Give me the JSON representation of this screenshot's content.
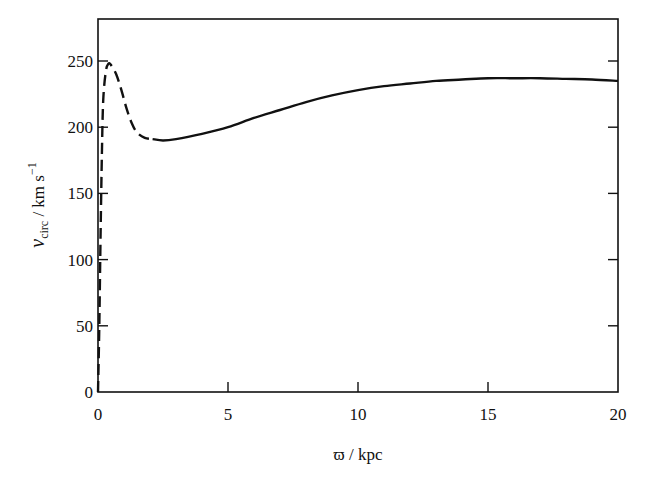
{
  "chart_data": {
    "type": "line",
    "title": "",
    "xlabel": "ϖ / kpc",
    "ylabel": "v_circ / km s^-1",
    "ylabel_parts": {
      "v": "v",
      "sub": "circ",
      "unit": " / km s",
      "sup": "−1"
    },
    "xlim": [
      0,
      20
    ],
    "ylim": [
      0,
      280
    ],
    "xticks": [
      0,
      5,
      10,
      15,
      20
    ],
    "yticks": [
      0,
      50,
      100,
      150,
      200,
      250
    ],
    "grid": false,
    "legend": null,
    "series": [
      {
        "name": "inner (dashed)",
        "style": "dashed",
        "x": [
          0.0,
          0.05,
          0.1,
          0.15,
          0.2,
          0.3,
          0.4,
          0.5,
          0.7,
          0.9,
          1.1,
          1.3,
          1.5,
          1.8,
          2.1
        ],
        "y": [
          0,
          50,
          120,
          180,
          220,
          242,
          248,
          247,
          240,
          228,
          214,
          203,
          196,
          192,
          191
        ]
      },
      {
        "name": "outer (solid)",
        "style": "solid",
        "x": [
          2.1,
          2.5,
          3,
          4,
          5,
          6,
          7,
          8,
          9,
          10,
          11,
          12,
          13,
          14,
          15,
          16,
          17,
          18,
          19,
          20
        ],
        "y": [
          191,
          190,
          191,
          195,
          200,
          207,
          213,
          219,
          224,
          228,
          231,
          233,
          235,
          236,
          237,
          237,
          237,
          236.5,
          236,
          235
        ]
      }
    ]
  },
  "labels": {
    "x_ticks": [
      "0",
      "5",
      "10",
      "15",
      "20"
    ],
    "y_ticks": [
      "0",
      "50",
      "100",
      "150",
      "200",
      "250"
    ]
  }
}
